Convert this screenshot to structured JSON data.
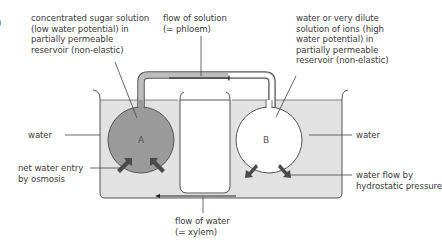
{
  "figure": {
    "edge_fragment": ")",
    "labels": {
      "reservoir_a": "concentrated sugar solution\n(low water potential) in\npartially permeable\nreservoir (non-elastic)",
      "phloem_flow": "flow of solution\n(= phloem)",
      "reservoir_b": "water or very dilute\nsolution of ions (high\nwater potential) in\npartially permeable\nreservoir (non-elastic)",
      "water_left": "water",
      "water_right": "water",
      "net_entry": "net water entry\nby osmosis",
      "hydrostatic": "water flow by\nhydrostatic pressure",
      "xylem_flow": "flow of water\n(= xylem)"
    },
    "bulbs": {
      "a": "A",
      "b": "B"
    },
    "colors": {
      "water": "#e2e2e2",
      "bulb_a_fill": "#9a9a9a",
      "bulb_b_fill": "#ffffff",
      "outline": "#555555",
      "arrow": "#4a4a4a",
      "tube_fill": "#bdbdbd"
    }
  }
}
